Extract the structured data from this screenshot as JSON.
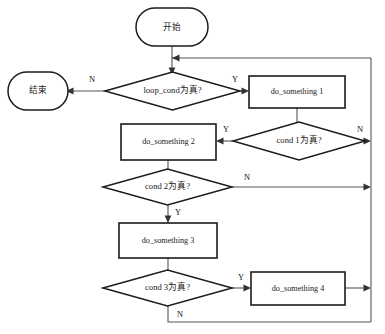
{
  "diagram": {
    "colors": {
      "background": "#ffffff",
      "node_stroke": "#1b1b1b",
      "node_fill": "#ffffff",
      "edge_stroke": "#555555",
      "text": "#1a1a1a"
    },
    "nodes": [
      {
        "id": "start",
        "shape": "terminator",
        "label": "开始"
      },
      {
        "id": "end",
        "shape": "terminator",
        "label": "结束"
      },
      {
        "id": "loop_cond",
        "shape": "decision",
        "label": "loop_cond为真?"
      },
      {
        "id": "do1",
        "shape": "process",
        "label": "do_something 1"
      },
      {
        "id": "cond1",
        "shape": "decision",
        "label": "cond 1为真?"
      },
      {
        "id": "do2",
        "shape": "process",
        "label": "do_something 2"
      },
      {
        "id": "cond2",
        "shape": "decision",
        "label": "cond 2为真?"
      },
      {
        "id": "do3",
        "shape": "process",
        "label": "do_something 3"
      },
      {
        "id": "cond3",
        "shape": "decision",
        "label": "cond 3为真?"
      },
      {
        "id": "do4",
        "shape": "process",
        "label": "do_something 4"
      }
    ],
    "edge_labels": {
      "loop_cond_no": "N",
      "loop_cond_yes": "Y",
      "cond1_no": "N",
      "cond1_yes": "Y",
      "cond2_no": "N",
      "cond2_yes": "Y",
      "cond3_no": "N",
      "cond3_yes": "Y"
    }
  }
}
